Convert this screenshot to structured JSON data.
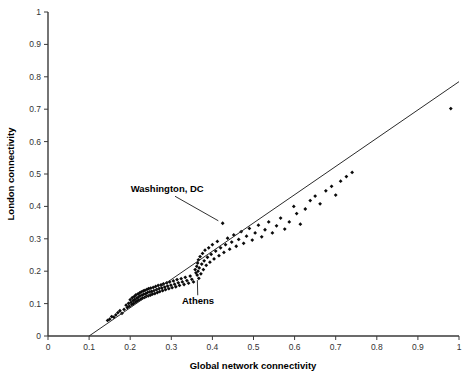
{
  "chart_data": {
    "type": "scatter",
    "title": "",
    "xlabel": "Global network connectivity",
    "ylabel": "London connectivity",
    "xlim": [
      0,
      1
    ],
    "ylim": [
      0,
      1
    ],
    "xticks": [
      "0",
      "0.1",
      "0.2",
      "0.3",
      "0.4",
      "0.5",
      "0.6",
      "0.7",
      "0.8",
      "0.9",
      "1"
    ],
    "yticks": [
      "0",
      "0.1",
      "0.2",
      "0.3",
      "0.4",
      "0.5",
      "0.6",
      "0.7",
      "0.8",
      "0.9",
      "1"
    ],
    "xtick_values": [
      0,
      0.1,
      0.2,
      0.3,
      0.4,
      0.5,
      0.6,
      0.7,
      0.8,
      0.9,
      1
    ],
    "ytick_values": [
      0,
      0.1,
      0.2,
      0.3,
      0.4,
      0.5,
      0.6,
      0.7,
      0.8,
      0.9,
      1
    ],
    "grid": false,
    "legend": null,
    "marker": "filled-diamond",
    "marker_color": "#0a0a0a",
    "trendline": {
      "type": "linear",
      "color": "#2b2b2b",
      "x_start": 0.1,
      "y_start": 0.0,
      "x_end": 1.0,
      "y_end": 0.785,
      "slope": 0.872,
      "intercept": -0.0872
    },
    "annotations": [
      {
        "label": "Washington, DC",
        "text_x": 0.29,
        "text_y": 0.445,
        "point_x": 0.425,
        "point_y": 0.348
      },
      {
        "label": "Athens",
        "text_x": 0.365,
        "text_y": 0.098,
        "point_x": 0.363,
        "point_y": 0.188
      }
    ],
    "points": [
      [
        0.185,
        0.082
      ],
      [
        0.19,
        0.095
      ],
      [
        0.193,
        0.088
      ],
      [
        0.196,
        0.101
      ],
      [
        0.198,
        0.092
      ],
      [
        0.2,
        0.112
      ],
      [
        0.202,
        0.104
      ],
      [
        0.204,
        0.097
      ],
      [
        0.205,
        0.118
      ],
      [
        0.207,
        0.109
      ],
      [
        0.208,
        0.1
      ],
      [
        0.21,
        0.122
      ],
      [
        0.211,
        0.113
      ],
      [
        0.213,
        0.105
      ],
      [
        0.214,
        0.127
      ],
      [
        0.216,
        0.117
      ],
      [
        0.217,
        0.108
      ],
      [
        0.219,
        0.13
      ],
      [
        0.22,
        0.12
      ],
      [
        0.221,
        0.111
      ],
      [
        0.223,
        0.133
      ],
      [
        0.224,
        0.124
      ],
      [
        0.226,
        0.114
      ],
      [
        0.227,
        0.136
      ],
      [
        0.229,
        0.126
      ],
      [
        0.23,
        0.117
      ],
      [
        0.232,
        0.139
      ],
      [
        0.233,
        0.129
      ],
      [
        0.235,
        0.119
      ],
      [
        0.236,
        0.141
      ],
      [
        0.238,
        0.131
      ],
      [
        0.239,
        0.122
      ],
      [
        0.241,
        0.144
      ],
      [
        0.242,
        0.134
      ],
      [
        0.244,
        0.124
      ],
      [
        0.245,
        0.146
      ],
      [
        0.247,
        0.136
      ],
      [
        0.249,
        0.126
      ],
      [
        0.25,
        0.148
      ],
      [
        0.252,
        0.138
      ],
      [
        0.254,
        0.129
      ],
      [
        0.256,
        0.15
      ],
      [
        0.258,
        0.14
      ],
      [
        0.26,
        0.131
      ],
      [
        0.262,
        0.153
      ],
      [
        0.264,
        0.143
      ],
      [
        0.266,
        0.134
      ],
      [
        0.268,
        0.156
      ],
      [
        0.27,
        0.146
      ],
      [
        0.272,
        0.137
      ],
      [
        0.275,
        0.158
      ],
      [
        0.277,
        0.148
      ],
      [
        0.279,
        0.14
      ],
      [
        0.281,
        0.161
      ],
      [
        0.284,
        0.151
      ],
      [
        0.286,
        0.143
      ],
      [
        0.289,
        0.164
      ],
      [
        0.291,
        0.154
      ],
      [
        0.294,
        0.146
      ],
      [
        0.296,
        0.167
      ],
      [
        0.299,
        0.157
      ],
      [
        0.302,
        0.149
      ],
      [
        0.305,
        0.17
      ],
      [
        0.308,
        0.16
      ],
      [
        0.311,
        0.152
      ],
      [
        0.314,
        0.174
      ],
      [
        0.317,
        0.164
      ],
      [
        0.32,
        0.156
      ],
      [
        0.324,
        0.177
      ],
      [
        0.327,
        0.167
      ],
      [
        0.331,
        0.159
      ],
      [
        0.334,
        0.181
      ],
      [
        0.338,
        0.171
      ],
      [
        0.342,
        0.163
      ],
      [
        0.346,
        0.185
      ],
      [
        0.35,
        0.175
      ],
      [
        0.354,
        0.167
      ],
      [
        0.358,
        0.205
      ],
      [
        0.36,
        0.195
      ],
      [
        0.362,
        0.215
      ],
      [
        0.363,
        0.188
      ],
      [
        0.364,
        0.225
      ],
      [
        0.365,
        0.2
      ],
      [
        0.366,
        0.235
      ],
      [
        0.367,
        0.178
      ],
      [
        0.368,
        0.21
      ],
      [
        0.37,
        0.245
      ],
      [
        0.372,
        0.192
      ],
      [
        0.374,
        0.222
      ],
      [
        0.376,
        0.255
      ],
      [
        0.378,
        0.205
      ],
      [
        0.38,
        0.232
      ],
      [
        0.382,
        0.265
      ],
      [
        0.385,
        0.218
      ],
      [
        0.388,
        0.243
      ],
      [
        0.391,
        0.272
      ],
      [
        0.394,
        0.228
      ],
      [
        0.397,
        0.252
      ],
      [
        0.4,
        0.282
      ],
      [
        0.404,
        0.238
      ],
      [
        0.408,
        0.262
      ],
      [
        0.412,
        0.292
      ],
      [
        0.416,
        0.248
      ],
      [
        0.42,
        0.272
      ],
      [
        0.425,
        0.348
      ],
      [
        0.428,
        0.258
      ],
      [
        0.432,
        0.282
      ],
      [
        0.437,
        0.302
      ],
      [
        0.442,
        0.268
      ],
      [
        0.447,
        0.29
      ],
      [
        0.452,
        0.312
      ],
      [
        0.458,
        0.277
      ],
      [
        0.464,
        0.298
      ],
      [
        0.47,
        0.322
      ],
      [
        0.476,
        0.286
      ],
      [
        0.483,
        0.308
      ],
      [
        0.49,
        0.332
      ],
      [
        0.497,
        0.296
      ],
      [
        0.504,
        0.318
      ],
      [
        0.512,
        0.342
      ],
      [
        0.52,
        0.306
      ],
      [
        0.528,
        0.328
      ],
      [
        0.537,
        0.352
      ],
      [
        0.546,
        0.318
      ],
      [
        0.556,
        0.34
      ],
      [
        0.566,
        0.364
      ],
      [
        0.576,
        0.33
      ],
      [
        0.587,
        0.352
      ],
      [
        0.598,
        0.4
      ],
      [
        0.605,
        0.378
      ],
      [
        0.614,
        0.345
      ],
      [
        0.626,
        0.392
      ],
      [
        0.638,
        0.418
      ],
      [
        0.65,
        0.432
      ],
      [
        0.662,
        0.408
      ],
      [
        0.676,
        0.448
      ],
      [
        0.69,
        0.462
      ],
      [
        0.7,
        0.435
      ],
      [
        0.712,
        0.478
      ],
      [
        0.726,
        0.492
      ],
      [
        0.74,
        0.505
      ],
      [
        0.17,
        0.072
      ],
      [
        0.175,
        0.078
      ],
      [
        0.18,
        0.07
      ],
      [
        0.165,
        0.065
      ],
      [
        0.16,
        0.058
      ],
      [
        0.155,
        0.06
      ],
      [
        0.15,
        0.052
      ],
      [
        0.145,
        0.048
      ],
      [
        0.98,
        0.702
      ]
    ],
    "outlier_note": "isolated point at upper right near (0.98, 0.70)",
    "n_points": 150
  },
  "axes": {
    "x_axis_name": "x-axis",
    "y_axis_name": "y-axis"
  }
}
